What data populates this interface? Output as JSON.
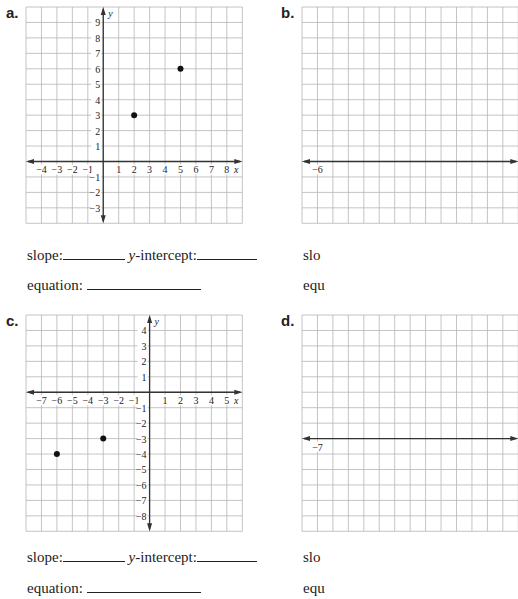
{
  "problems": [
    {
      "label": "a.",
      "grid": {
        "x": 26,
        "y": 7,
        "cell": 15.45,
        "xmin": -5,
        "xmax": 9,
        "ymin": -4,
        "ymax": 10
      },
      "x_tick_labels": [
        "−4",
        "−3",
        "−2",
        "−1",
        "1",
        "2",
        "3",
        "4",
        "5",
        "6",
        "7",
        "8"
      ],
      "x_ticks": [
        -4,
        -3,
        -2,
        -1,
        1,
        2,
        3,
        4,
        5,
        6,
        7,
        8
      ],
      "y_ticks": [
        9,
        8,
        7,
        6,
        5,
        4,
        3,
        2,
        1,
        -1,
        -2,
        -3
      ],
      "x_axis_label": "x",
      "y_axis_label": "y",
      "points": [
        [
          2,
          3
        ],
        [
          5,
          6
        ]
      ],
      "slope_label": "slope:",
      "intercept_prefix": "y",
      "intercept_label": "-intercept:",
      "equation_label": "equation:",
      "text_y": 247
    },
    {
      "label": "b.",
      "grid": {
        "x": 302,
        "y": 7,
        "cell": 15.45,
        "xmin": -7,
        "xmax": 7,
        "ymin": -4,
        "ymax": 10
      },
      "x_tick_labels": [
        "−6"
      ],
      "x_ticks": [
        -6
      ],
      "y_ticks": [],
      "x_axis_label": "",
      "y_axis_label": "",
      "points": [],
      "slope_label": "slo",
      "equation_label": "equ",
      "text_y": 247
    },
    {
      "label": "c.",
      "grid": {
        "x": 26,
        "y": 315,
        "cell": 15.45,
        "xmin": -8,
        "xmax": 6,
        "ymin": -9,
        "ymax": 5
      },
      "x_tick_labels": [
        "−7",
        "−6",
        "−5",
        "−4",
        "−3",
        "−2",
        "−1",
        "1",
        "2",
        "3",
        "4",
        "5"
      ],
      "x_ticks": [
        -7,
        -6,
        -5,
        -4,
        -3,
        -2,
        -1,
        1,
        2,
        3,
        4,
        5
      ],
      "y_ticks": [
        4,
        3,
        2,
        1,
        -1,
        -2,
        -3,
        -4,
        -5,
        -6,
        -7,
        -8
      ],
      "x_axis_label": "x",
      "y_axis_label": "y",
      "points": [
        [
          -6,
          -4
        ],
        [
          -3,
          -3
        ]
      ],
      "slope_label": "slope:",
      "intercept_prefix": "y",
      "intercept_label": "-intercept:",
      "equation_label": "equation:",
      "text_y": 549
    },
    {
      "label": "d.",
      "grid": {
        "x": 302,
        "y": 315,
        "cell": 15.45,
        "xmin": -8,
        "xmax": 6,
        "ymin": -6,
        "ymax": 8
      },
      "x_tick_labels": [
        "−7"
      ],
      "x_ticks": [
        -7
      ],
      "y_ticks": [],
      "x_axis_label": "",
      "y_axis_label": "",
      "points": [],
      "slope_label": "slo",
      "equation_label": "equ",
      "text_y": 549
    }
  ],
  "colors": {
    "grid": "#b5b5b5",
    "axis": "#333333",
    "point": "#111111",
    "text": "#222222"
  }
}
